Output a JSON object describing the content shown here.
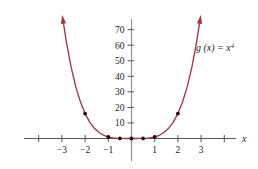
{
  "chart_data": {
    "type": "line",
    "title": "",
    "subtitle": "",
    "function_label": "g (x) = x",
    "function_exponent": "4",
    "expression": "g(x) = x^4",
    "xlabel": "x",
    "ylabel": "",
    "xlim": [
      -4.6,
      4.6
    ],
    "ylim": [
      -8,
      78
    ],
    "grid": false,
    "legend_position": "upper-right-inline",
    "x_ticks": [
      -4,
      -3,
      -2,
      -1,
      1,
      2,
      3,
      4
    ],
    "x_tick_labels": [
      "",
      "−3",
      "−2",
      "−1",
      "1",
      "2",
      "3",
      ""
    ],
    "y_ticks": [
      10,
      20,
      30,
      40,
      50,
      60,
      70
    ],
    "y_tick_labels": [
      "10",
      "20",
      "30",
      "40",
      "50",
      "60",
      "70"
    ],
    "series": [
      {
        "name": "g(x) = x^4",
        "color": "#a8343f",
        "x": [
          -2.95,
          -2.8,
          -2.6,
          -2.4,
          -2.2,
          -2.0,
          -1.8,
          -1.6,
          -1.4,
          -1.2,
          -1.0,
          -0.8,
          -0.6,
          -0.4,
          -0.2,
          0.0,
          0.2,
          0.4,
          0.6,
          0.8,
          1.0,
          1.2,
          1.4,
          1.6,
          1.8,
          2.0,
          2.2,
          2.4,
          2.6,
          2.8,
          2.95
        ],
        "y": [
          75.76,
          61.47,
          45.7,
          33.18,
          23.43,
          16.0,
          10.5,
          6.55,
          3.84,
          2.07,
          1.0,
          0.41,
          0.13,
          0.03,
          0.0016,
          0.0,
          0.0016,
          0.03,
          0.13,
          0.41,
          1.0,
          2.07,
          3.84,
          6.55,
          10.5,
          16.0,
          23.43,
          33.18,
          45.7,
          61.47,
          75.76
        ]
      }
    ],
    "marked_points": [
      {
        "x": -2,
        "y": 16
      },
      {
        "x": -1,
        "y": 1
      },
      {
        "x": -0.5,
        "y": 0.0625
      },
      {
        "x": 0,
        "y": 0
      },
      {
        "x": 0.5,
        "y": 0.0625
      },
      {
        "x": 1,
        "y": 1
      },
      {
        "x": 2,
        "y": 16
      }
    ],
    "arrowheads": [
      "left-branch-top",
      "right-branch-top"
    ],
    "point_color": "#111111",
    "axis_color": "#55555a"
  }
}
